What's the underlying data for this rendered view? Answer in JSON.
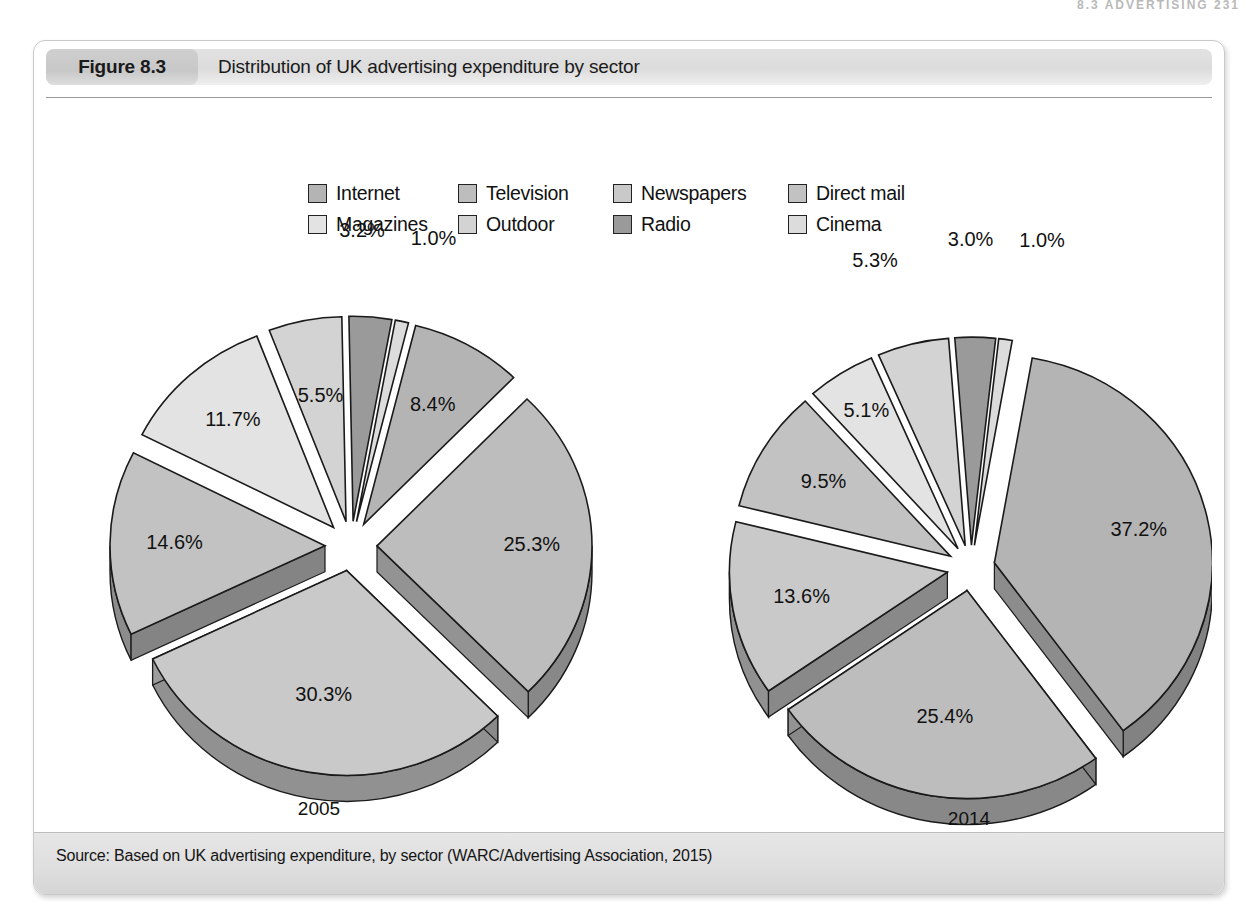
{
  "running_head": "8.3 ADVERTISING  231",
  "figure": {
    "number_label": "Figure 8.3",
    "title": "Distribution of UK advertising expenditure by sector",
    "source": "Source: Based on UK advertising expenditure, by sector (WARC/Advertising Association, 2015)"
  },
  "colors": {
    "internet": "#b4b4b4",
    "television": "#bdbdbd",
    "newspapers": "#c9c9c9",
    "direct_mail": "#c2c2c2",
    "magazines": "#e3e3e3",
    "outdoor": "#d3d3d3",
    "radio": "#9a9a9a",
    "cinema": "#dcdcdc",
    "edge": "#8b8b8b",
    "outline": "#1a1a1a",
    "header_bar": "#dcdcdc",
    "footer_bar": "#dedede"
  },
  "legend": {
    "items": [
      {
        "label": "Internet",
        "key": "internet"
      },
      {
        "label": "Television",
        "key": "television"
      },
      {
        "label": "Newspapers",
        "key": "newspapers"
      },
      {
        "label": "Direct mail",
        "key": "direct_mail"
      },
      {
        "label": "Magazines",
        "key": "magazines"
      },
      {
        "label": "Outdoor",
        "key": "outdoor"
      },
      {
        "label": "Radio",
        "key": "radio"
      },
      {
        "label": "Cinema",
        "key": "cinema"
      }
    ]
  },
  "chart_data": {
    "type": "pie",
    "title": "Distribution of UK advertising expenditure by sector",
    "legend_position": "top-center",
    "grid": false,
    "exploded": true,
    "three_d": true,
    "units": "percent",
    "categories": [
      "Internet",
      "Television",
      "Newspapers",
      "Direct mail",
      "Magazines",
      "Outdoor",
      "Radio",
      "Cinema"
    ],
    "series": [
      {
        "name": "2005",
        "caption": "2005",
        "values": [
          8.4,
          25.3,
          30.3,
          14.6,
          11.7,
          5.5,
          3.2,
          1.0
        ],
        "labels": [
          "8.4%",
          "25.3%",
          "30.3%",
          "14.6%",
          "11.7%",
          "5.5%",
          "3.2%",
          "1.0%"
        ]
      },
      {
        "name": "2014",
        "caption": "2014",
        "values": [
          37.2,
          25.4,
          13.6,
          9.5,
          5.1,
          5.3,
          3.0,
          1.0
        ],
        "labels": [
          "37.2%",
          "25.4%",
          "13.6%",
          "9.5%",
          "5.1%",
          "5.3%",
          "3.0%",
          "1.0%"
        ]
      }
    ]
  }
}
